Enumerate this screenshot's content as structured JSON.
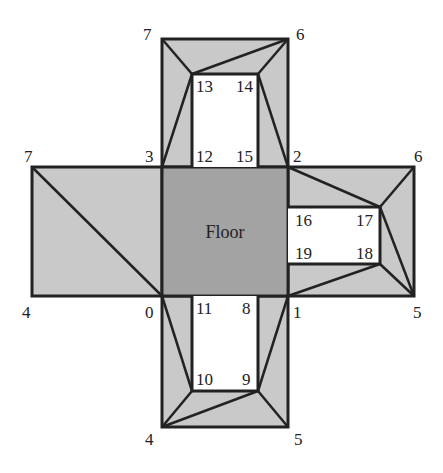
{
  "diagram": {
    "colors": {
      "panel": "#c9c9c9",
      "floor": "#a3a3a3",
      "hole": "#ffffff",
      "stroke": "#222222"
    },
    "floor_label": "Floor",
    "vertex_labels": {
      "top_7": "7",
      "top_6": "6",
      "v13": "13",
      "v14": "14",
      "v12": "12",
      "v15": "15",
      "left_7": "7",
      "v3": "3",
      "v2": "2",
      "right_6": "6",
      "v16": "16",
      "v17": "17",
      "v19": "19",
      "v18": "18",
      "left_4": "4",
      "v0": "0",
      "v11": "11",
      "v8": "8",
      "v1": "1",
      "right_5": "5",
      "v10": "10",
      "v9": "9",
      "bottom_4": "4",
      "bottom_5": "5"
    }
  }
}
